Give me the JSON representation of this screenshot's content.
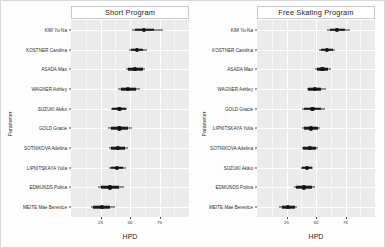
{
  "figure": {
    "axis_title_x": "HPD",
    "axis_title_y": "Parameter",
    "background_color": "#fdfdfd",
    "panel_color": "#ebebeb",
    "gridline_color": "#ffffff",
    "point_color": "#111111"
  },
  "chart_data": {
    "type": "scatter",
    "subtype": "forest-plot-hpd-interval",
    "title": "",
    "xlabel": "HPD",
    "ylabel": "Parameter",
    "grid": true,
    "legend": null,
    "xlim": [
      0,
      100
    ],
    "x_ticks": [
      25,
      50,
      75
    ],
    "x_tick_labels": [
      "25",
      "50",
      "75"
    ],
    "panels": [
      {
        "label": "Short Program",
        "categories": [
          "KIM Yu-Na",
          "KOSTNER Carolina",
          "ASADA Mao",
          "WAGNER Ashley",
          "SUZUKI Akiko",
          "GOLD Gracie",
          "SOTNIKOVA Adelina",
          "LIPNITSKAYA Yulia",
          "EDMUNDS Polina",
          "MEITE Mae Berenice"
        ],
        "series": [
          {
            "name": "HPD interval",
            "points": [
              {
                "category": "KIM Yu-Na",
                "estimate": 62.0,
                "inner_low": 54.0,
                "inner_high": 70.0,
                "outer_low": 52.0,
                "outer_high": 78.0
              },
              {
                "category": "KOSTNER Carolina",
                "estimate": 56.0,
                "inner_low": 50.5,
                "inner_high": 61.0,
                "outer_low": 49.0,
                "outer_high": 64.5
              },
              {
                "category": "ASADA Mao",
                "estimate": 54.5,
                "inner_low": 48.0,
                "inner_high": 61.0,
                "outer_low": 46.5,
                "outer_high": 63.0
              },
              {
                "category": "WAGNER Ashley",
                "estimate": 48.5,
                "inner_low": 42.5,
                "inner_high": 55.0,
                "outer_low": 39.5,
                "outer_high": 58.5
              },
              {
                "category": "SUZUKI Akiko",
                "estimate": 41.0,
                "inner_low": 35.0,
                "inner_high": 46.5,
                "outer_low": 34.0,
                "outer_high": 47.5
              },
              {
                "category": "GOLD Gracie",
                "estimate": 41.0,
                "inner_low": 33.5,
                "inner_high": 48.0,
                "outer_low": 31.5,
                "outer_high": 52.0
              },
              {
                "category": "SOTNIKOVA Adelina",
                "estimate": 39.5,
                "inner_low": 33.5,
                "inner_high": 45.5,
                "outer_low": 32.5,
                "outer_high": 48.5
              },
              {
                "category": "LIPNITSKAYA Yulia",
                "estimate": 39.0,
                "inner_low": 33.5,
                "inner_high": 44.5,
                "outer_low": 32.5,
                "outer_high": 46.5
              },
              {
                "category": "EDMUNDS Polina",
                "estimate": 33.0,
                "inner_low": 25.0,
                "inner_high": 41.0,
                "outer_low": 23.0,
                "outer_high": 45.0
              },
              {
                "category": "MEITE Mae Berenice",
                "estimate": 26.0,
                "inner_low": 19.0,
                "inner_high": 33.0,
                "outer_low": 17.0,
                "outer_high": 37.0
              }
            ]
          }
        ]
      },
      {
        "label": "Free Skating Program",
        "categories": [
          "KIM Yu-Na",
          "KOSTNER Carolina",
          "ASADA Mao",
          "WAGNER Ashley",
          "GOLD Gracie",
          "LIPNITSKAYA Yulia",
          "SOTNIKOVA Adelina",
          "SUZUKI Akiko",
          "EDMUNDS Polina",
          "MEITE Mae Berenice"
        ],
        "series": [
          {
            "name": "HPD interval",
            "points": [
              {
                "category": "KIM Yu-Na",
                "estimate": 68.0,
                "inner_low": 61.5,
                "inner_high": 74.5,
                "outer_low": 59.5,
                "outer_high": 78.5
              },
              {
                "category": "KOSTNER Carolina",
                "estimate": 59.0,
                "inner_low": 54.0,
                "inner_high": 64.0,
                "outer_low": 52.5,
                "outer_high": 66.5
              },
              {
                "category": "ASADA Mao",
                "estimate": 55.5,
                "inner_low": 50.5,
                "inner_high": 60.5,
                "outer_low": 49.5,
                "outer_high": 62.5
              },
              {
                "category": "WAGNER Ashley",
                "estimate": 49.0,
                "inner_low": 43.5,
                "inner_high": 54.5,
                "outer_low": 42.0,
                "outer_high": 58.5
              },
              {
                "category": "GOLD Gracie",
                "estimate": 47.0,
                "inner_low": 40.0,
                "inner_high": 54.0,
                "outer_low": 38.5,
                "outer_high": 57.5
              },
              {
                "category": "LIPNITSKAYA Yulia",
                "estimate": 45.5,
                "inner_low": 39.5,
                "inner_high": 51.5,
                "outer_low": 38.5,
                "outer_high": 53.5
              },
              {
                "category": "SOTNIKOVA Adelina",
                "estimate": 44.5,
                "inner_low": 39.0,
                "inner_high": 50.0,
                "outer_low": 38.0,
                "outer_high": 52.0
              },
              {
                "category": "SUZUKI Akiko",
                "estimate": 42.5,
                "inner_low": 38.5,
                "inner_high": 46.5,
                "outer_low": 37.5,
                "outer_high": 47.5
              },
              {
                "category": "EDMUNDS Polina",
                "estimate": 40.0,
                "inner_low": 33.0,
                "inner_high": 47.0,
                "outer_low": 31.5,
                "outer_high": 49.5
              },
              {
                "category": "MEITE Mae Berenice",
                "estimate": 26.5,
                "inner_low": 21.0,
                "inner_high": 32.0,
                "outer_low": 19.0,
                "outer_high": 33.5
              }
            ]
          }
        ]
      }
    ]
  }
}
